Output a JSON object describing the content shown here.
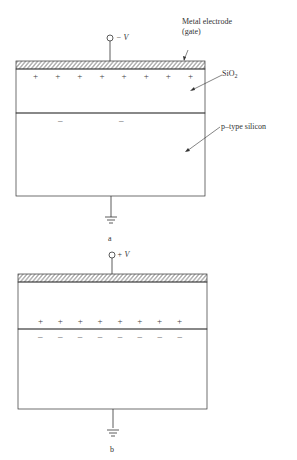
{
  "figure_a": {
    "voltage_label": "− V",
    "labels": {
      "gate": "Metal electrode",
      "gate_paren": "(gate)",
      "oxide": "SiO",
      "oxide_sub": "2",
      "substrate": "p–type silicon"
    },
    "oxide_charges": [
      "+",
      "+",
      "+",
      "+",
      "+",
      "+",
      "+",
      "+"
    ],
    "substrate_charges": [
      "–",
      "–"
    ],
    "caption": "a"
  },
  "figure_b": {
    "voltage_label": "+ V",
    "positive_charges": [
      "+",
      "+",
      "+",
      "+",
      "+",
      "+",
      "+",
      "+"
    ],
    "negative_charges": [
      "–",
      "–",
      "–",
      "–",
      "–",
      "–",
      "–",
      "–"
    ],
    "caption": "b"
  }
}
